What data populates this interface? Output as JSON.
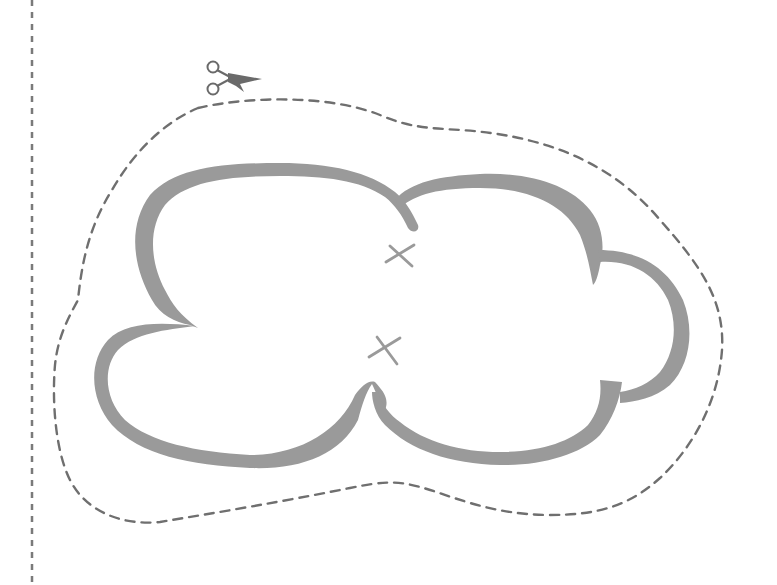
{
  "template": {
    "title": "Cloud cut-out template",
    "subject": "cloud",
    "instruction": "Cut along the dashed line"
  },
  "colors": {
    "background": "#ffffff",
    "cloud_outline": "#9a9a9a",
    "cut_line": "#6f6f6f",
    "fold_margin": "#7a7a7a",
    "scissors": "#6a6a6a",
    "x_marks": "#9a9a9a"
  },
  "icons": {
    "scissors": "scissors-icon",
    "x_mark": "x-mark-icon"
  },
  "elements": {
    "margin_line": {
      "x": 32,
      "style": "dashed vertical"
    },
    "cut_line": {
      "style": "dashed closed curve"
    },
    "cloud": {
      "lobes": 5
    },
    "x_marks": [
      {
        "x": 399,
        "y": 255
      },
      {
        "x": 384,
        "y": 350
      }
    ],
    "scissors": {
      "x": 232,
      "y": 78
    }
  }
}
